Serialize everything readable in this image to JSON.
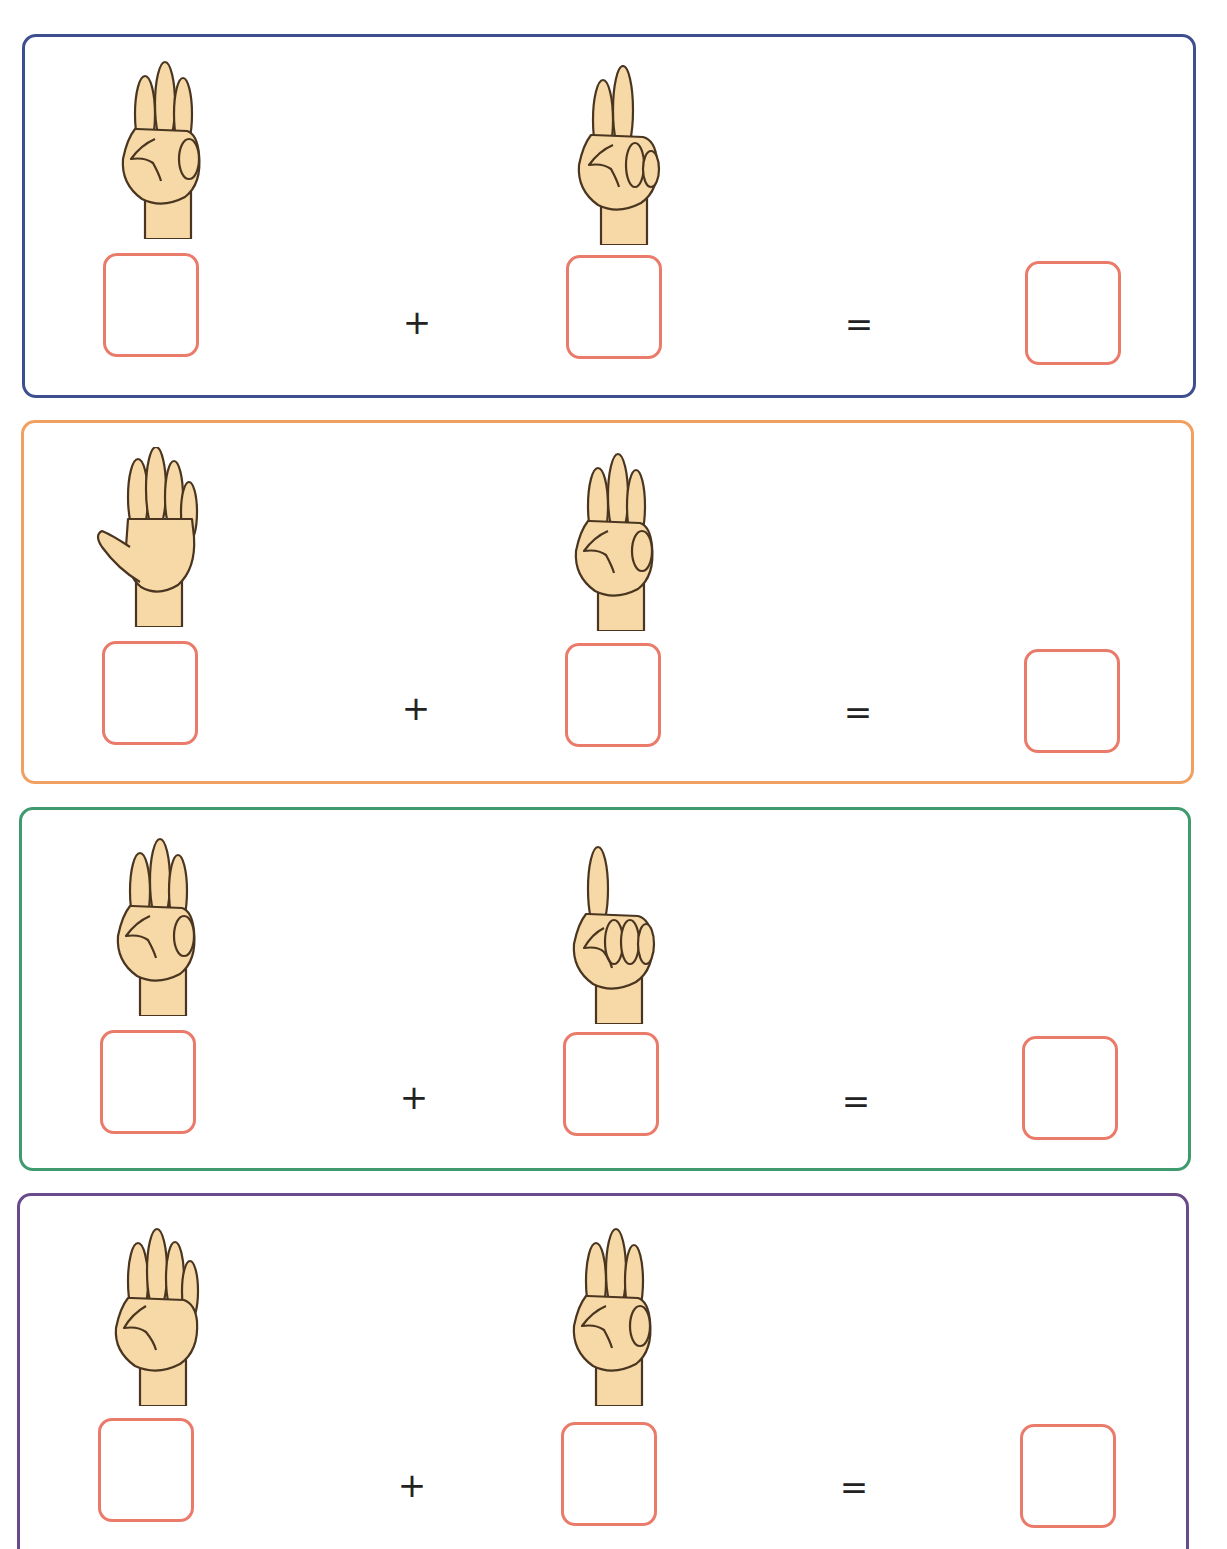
{
  "worksheet": {
    "plus_sign": "+",
    "equals_sign": "=",
    "answer_box_color": "#ea7b6b",
    "skin_color": "#f6d9a6",
    "outline_color": "#4a3520",
    "problems": [
      {
        "border_color": "#3d4f8f",
        "left_hand": {
          "fingers": 3,
          "icon": "hand-three-fingers-icon"
        },
        "right_hand": {
          "fingers": 2,
          "icon": "hand-two-fingers-icon"
        },
        "left_value": "",
        "right_value": "",
        "answer": ""
      },
      {
        "border_color": "#f0a060",
        "left_hand": {
          "fingers": 5,
          "icon": "hand-five-fingers-icon"
        },
        "right_hand": {
          "fingers": 3,
          "icon": "hand-three-fingers-icon"
        },
        "left_value": "",
        "right_value": "",
        "answer": ""
      },
      {
        "border_color": "#3f9a6e",
        "left_hand": {
          "fingers": 3,
          "icon": "hand-three-fingers-icon"
        },
        "right_hand": {
          "fingers": 1,
          "icon": "hand-one-finger-icon"
        },
        "left_value": "",
        "right_value": "",
        "answer": ""
      },
      {
        "border_color": "#6a4a8a",
        "left_hand": {
          "fingers": 4,
          "icon": "hand-four-fingers-icon"
        },
        "right_hand": {
          "fingers": 3,
          "icon": "hand-three-fingers-icon"
        },
        "left_value": "",
        "right_value": "",
        "answer": ""
      }
    ]
  }
}
